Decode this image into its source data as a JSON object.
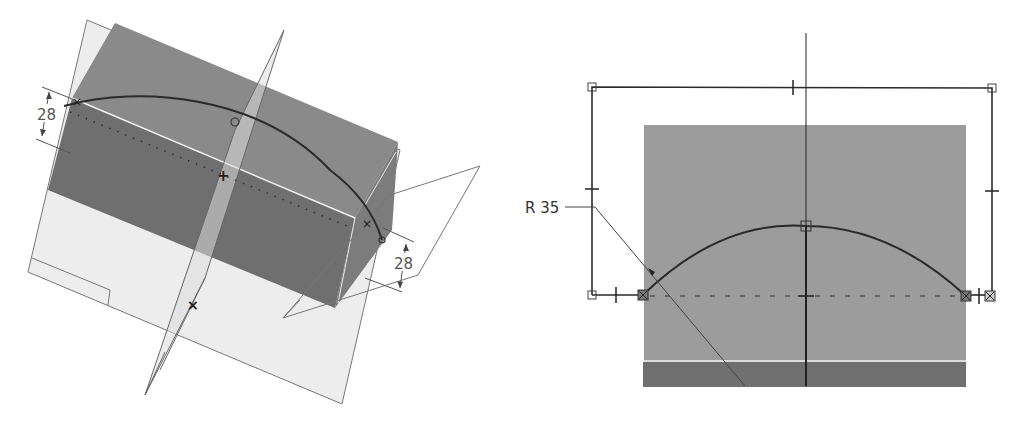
{
  "views": {
    "iso_view": {
      "dimensions": [
        {
          "id": "left_height",
          "value": "28"
        },
        {
          "id": "right_height",
          "value": "28"
        }
      ]
    },
    "sketch_view": {
      "dimensions": [
        {
          "id": "radius",
          "value": "R 35"
        }
      ]
    }
  },
  "colors": {
    "background": "#ffffff",
    "solid_front_face": "#6e6e6e",
    "solid_top_face": "#8a8a8a",
    "solid_side_face": "#7a7a7a",
    "plane_fill": "#ececec",
    "plane_edge": "#777777",
    "sketch_line": "#2a2a2a",
    "sketch_face": "#9a9a9a",
    "sketch_band": "#6e6e6e"
  }
}
